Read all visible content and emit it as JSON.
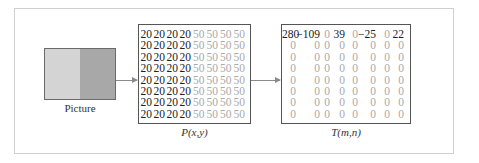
{
  "diagram": {
    "picture": {
      "label": "Picture",
      "left_color": "#d4d4d4",
      "right_color": "#a8a8a8"
    },
    "matrix_p": {
      "label": "P(x,y)",
      "rows": [
        [
          "20",
          "20",
          "20",
          "20",
          "50",
          "50",
          "50",
          "50"
        ],
        [
          "20",
          "20",
          "20",
          "20",
          "50",
          "50",
          "50",
          "50"
        ],
        [
          "20",
          "20",
          "20",
          "20",
          "50",
          "50",
          "50",
          "50"
        ],
        [
          "20",
          "20",
          "20",
          "20",
          "50",
          "50",
          "50",
          "50"
        ],
        [
          "20",
          "20",
          "20",
          "20",
          "50",
          "50",
          "50",
          "50"
        ],
        [
          "20",
          "20",
          "20",
          "20",
          "50",
          "50",
          "50",
          "50"
        ],
        [
          "20",
          "20",
          "20",
          "20",
          "50",
          "50",
          "50",
          "50"
        ],
        [
          "20",
          "20",
          "20",
          "20",
          "50",
          "50",
          "50",
          "50"
        ]
      ]
    },
    "matrix_t": {
      "label": "T(m,n)",
      "rows": [
        [
          "280",
          "−109",
          "0",
          "39",
          "0",
          "−25",
          "0",
          "22"
        ],
        [
          "0",
          "0",
          "0",
          "0",
          "0",
          "0",
          "0",
          "0"
        ],
        [
          "0",
          "0",
          "0",
          "0",
          "0",
          "0",
          "0",
          "0"
        ],
        [
          "0",
          "0",
          "0",
          "0",
          "0",
          "0",
          "0",
          "0"
        ],
        [
          "0",
          "0",
          "0",
          "0",
          "0",
          "0",
          "0",
          "0"
        ],
        [
          "0",
          "0",
          "0",
          "0",
          "0",
          "0",
          "0",
          "0"
        ],
        [
          "0",
          "0",
          "0",
          "0",
          "0",
          "0",
          "0",
          "0"
        ],
        [
          "0",
          "0",
          "0",
          "0",
          "0",
          "0",
          "0",
          "0"
        ]
      ]
    },
    "colors": {
      "dark_value": "#222222",
      "light_value": "#a9a9a9",
      "arrow": "#8a8a8a"
    }
  }
}
